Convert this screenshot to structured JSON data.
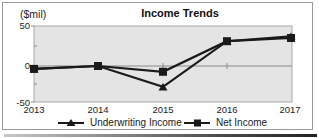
{
  "chart_data": {
    "type": "line",
    "title": "Income Trends",
    "ylabel": "($mil)",
    "xlabel": "",
    "categories": [
      "2013",
      "2014",
      "2015",
      "2016",
      "2017"
    ],
    "series": [
      {
        "name": "Underwriting Income",
        "marker": "triangle",
        "values": [
          -4,
          0,
          -29,
          31,
          37
        ]
      },
      {
        "name": "Net Income",
        "marker": "square",
        "values": [
          -4,
          0,
          -8,
          31,
          35
        ]
      }
    ],
    "ylim": [
      -50,
      50
    ],
    "yticks": [
      "50",
      "0",
      "-50"
    ],
    "grid": false,
    "zero_line": true,
    "legend_position": "bottom",
    "plot_background": "#e4e4e4",
    "line_color": "#1a1a1a"
  },
  "labels": {
    "unit": "($mil)",
    "title": "Income Trends",
    "yticks": [
      {
        "label": "50"
      },
      {
        "label": "0"
      },
      {
        "label": "-50"
      }
    ],
    "xticks": [
      {
        "label": "2013"
      },
      {
        "label": "2014"
      },
      {
        "label": "2015"
      },
      {
        "label": "2016"
      },
      {
        "label": "2017"
      }
    ],
    "legend": {
      "underwriting": "Underwriting Income",
      "net": "Net Income"
    }
  }
}
